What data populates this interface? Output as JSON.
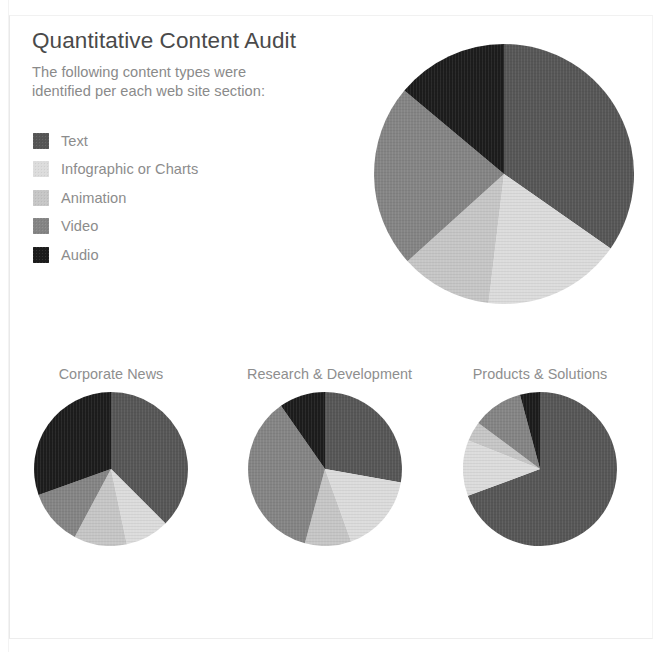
{
  "header": {
    "title": "Quantitative Content Audit",
    "subtitle_line1": "The following content types were",
    "subtitle_line2": "identified per each web site section:"
  },
  "legend": {
    "items": [
      {
        "label": "Text",
        "color": "#565656",
        "key": "text"
      },
      {
        "label": "Infographic or Charts",
        "color": "#dcdcdc",
        "key": "infographic"
      },
      {
        "label": "Animation",
        "color": "#c6c6c6",
        "key": "animation"
      },
      {
        "label": "Video",
        "color": "#848484",
        "key": "video"
      },
      {
        "label": "Audio",
        "color": "#1c1c1c",
        "key": "audio"
      }
    ]
  },
  "colors": {
    "text": "#565656",
    "infographic": "#dcdcdc",
    "animation": "#c6c6c6",
    "video": "#848484",
    "audio": "#1c1c1c",
    "title": "#4a4a4a",
    "body": "#8a8a8a",
    "background": "#ffffff"
  },
  "chart_data": [
    {
      "type": "pie",
      "title": "Overall",
      "id": "overall",
      "labels": [
        "Text",
        "Infographic or Charts",
        "Animation",
        "Video",
        "Audio"
      ],
      "values": [
        34.7,
        17.2,
        11.4,
        22.8,
        13.9
      ],
      "colors": [
        "#565656",
        "#dcdcdc",
        "#c6c6c6",
        "#848484",
        "#1c1c1c"
      ],
      "start_angle": 0,
      "direction": "clockwise",
      "radius": 130,
      "legend": "external-left"
    },
    {
      "type": "pie",
      "title": "Corporate News",
      "id": "corporate-news",
      "labels": [
        "Text",
        "Infographic or Charts",
        "Animation",
        "Video",
        "Audio"
      ],
      "values": [
        37.5,
        9.2,
        11.1,
        11.7,
        30.5
      ],
      "colors": [
        "#565656",
        "#dcdcdc",
        "#c6c6c6",
        "#848484",
        "#1c1c1c"
      ],
      "start_angle": 0,
      "direction": "clockwise",
      "radius": 77,
      "legend": "none"
    },
    {
      "type": "pie",
      "title": "Research & Development",
      "id": "research-development",
      "labels": [
        "Text",
        "Infographic or Charts",
        "Animation",
        "Video",
        "Audio"
      ],
      "values": [
        27.8,
        16.7,
        9.7,
        36.1,
        9.7
      ],
      "colors": [
        "#565656",
        "#dcdcdc",
        "#c6c6c6",
        "#848484",
        "#1c1c1c"
      ],
      "start_angle": 0,
      "direction": "clockwise",
      "radius": 77,
      "legend": "none"
    },
    {
      "type": "pie",
      "title": "Products & Solutions",
      "id": "products-solutions",
      "labels": [
        "Text",
        "Infographic or Charts",
        "Animation",
        "Video",
        "Audio"
      ],
      "values": [
        69.4,
        11.7,
        4.2,
        10.6,
        4.2
      ],
      "colors": [
        "#565656",
        "#dcdcdc",
        "#c6c6c6",
        "#848484",
        "#1c1c1c"
      ],
      "start_angle": 0,
      "direction": "clockwise",
      "radius": 77,
      "legend": "none"
    }
  ],
  "small_chart_positions": [
    {
      "left": 33,
      "width": 156
    },
    {
      "left": 247,
      "width": 156
    },
    {
      "left": 462,
      "width": 156
    }
  ]
}
